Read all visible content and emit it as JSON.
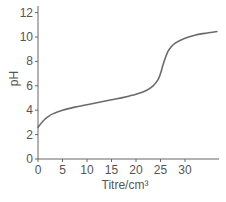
{
  "chart_data": {
    "type": "line",
    "title": "",
    "xlabel": "Titre/cm³",
    "ylabel": "pH",
    "xlim": [
      0,
      37
    ],
    "ylim": [
      0,
      12.5
    ],
    "xticks": [
      0,
      5,
      10,
      15,
      20,
      25,
      30
    ],
    "xtick_labels": [
      "0",
      "5",
      "10",
      "15",
      "20",
      "25",
      "30"
    ],
    "yticks": [
      0,
      2,
      4,
      6,
      8,
      10,
      12
    ],
    "ytick_labels": [
      "0",
      "2",
      "4",
      "6",
      "8",
      "10",
      "12"
    ],
    "grid": false,
    "legend": null,
    "series": [
      {
        "name": "pH curve",
        "color": "#6b6b6b",
        "x": [
          0,
          1,
          2,
          3,
          5,
          7.5,
          10,
          12.5,
          15,
          17.5,
          20,
          22,
          23.5,
          24.5,
          25,
          25.5,
          26,
          26.5,
          27,
          28,
          30,
          32,
          34,
          36.5
        ],
        "y": [
          2.6,
          3.1,
          3.45,
          3.7,
          4.0,
          4.25,
          4.45,
          4.65,
          4.85,
          5.05,
          5.3,
          5.6,
          6.0,
          6.5,
          7.0,
          7.7,
          8.3,
          8.8,
          9.1,
          9.5,
          9.9,
          10.15,
          10.3,
          10.45
        ]
      }
    ]
  }
}
